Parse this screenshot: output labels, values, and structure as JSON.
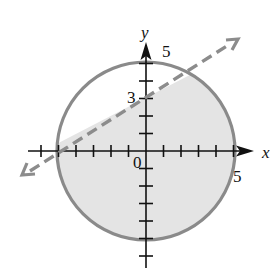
{
  "chart_data": {
    "type": "region-plot",
    "title": "",
    "xlabel": "x",
    "ylabel": "y",
    "xlim": [
      -6,
      6
    ],
    "ylim": [
      -6,
      6
    ],
    "grid": false,
    "tick_step": 1,
    "labeled_ticks": {
      "origin": "0",
      "x": [
        {
          "value": 5,
          "label": "5"
        }
      ],
      "y": [
        {
          "value": 3,
          "label": "3"
        },
        {
          "value": 5,
          "label": "5"
        }
      ]
    },
    "curves": [
      {
        "name": "circle",
        "equation": "x^2 + y^2 = 25",
        "style": "solid",
        "center": [
          0,
          0
        ],
        "radius": 5
      },
      {
        "name": "line",
        "equation": "y = (3/5)x + 3",
        "style": "dashed",
        "slope": 0.6,
        "intercept": 3,
        "points": [
          [
            -5,
            0
          ],
          [
            0,
            3
          ]
        ]
      }
    ],
    "shaded_region": "inside circle and below dashed line",
    "colors": {
      "circle_stroke": "#8a8a8a",
      "line_stroke": "#8c8c8c",
      "fill": "#e4e4e4",
      "axes": "#111111"
    }
  },
  "labels": {
    "x_axis": "x",
    "y_axis": "y",
    "origin": "0",
    "x_tick_5": "5",
    "y_tick_5": "5",
    "y_tick_3": "3"
  }
}
